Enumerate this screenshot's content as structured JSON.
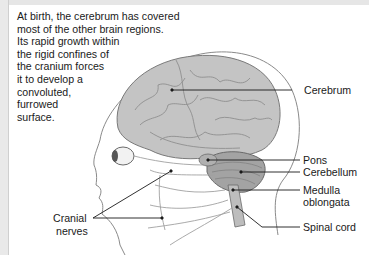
{
  "caption": {
    "lines": [
      "At birth, the cerebrum has covered",
      "most of the other brain regions.",
      "Its rapid growth within",
      "the rigid confines of",
      "the cranium forces",
      "it to develop a",
      "convoluted,",
      "furrowed",
      "surface."
    ]
  },
  "labels": {
    "cerebrum": "Cerebrum",
    "pons": "Pons",
    "cerebellum": "Cerebellum",
    "medulla_line1": "Medulla",
    "medulla_line2": "oblongata",
    "spinal_cord": "Spinal cord",
    "cranial_line1": "Cranial",
    "cranial_line2": "nerves"
  },
  "colors": {
    "brain": "#bdbdbd",
    "brain_dark": "#8a8a8a",
    "outline": "#7a7a7a",
    "leader": "#1a1a1a",
    "text": "#1a1a1a"
  }
}
